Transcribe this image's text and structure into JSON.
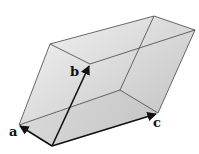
{
  "diagram": {
    "labels": {
      "a": "a",
      "b": "b",
      "c": "c"
    },
    "colors": {
      "face_fill": "#c8c8c8",
      "face_light": "#f2f2f2",
      "edge": "#333333",
      "vector": "#111111"
    },
    "vertices": {
      "origin": [
        52,
        146
      ],
      "a": [
        19,
        125
      ],
      "b": [
        90,
        64
      ],
      "c": [
        158,
        113
      ],
      "a_plus_b": [
        50,
        44
      ],
      "b_plus_c": [
        195,
        30
      ],
      "a_plus_b_plus_c": [
        154,
        16
      ],
      "a_plus_c": [
        120,
        90
      ]
    }
  }
}
